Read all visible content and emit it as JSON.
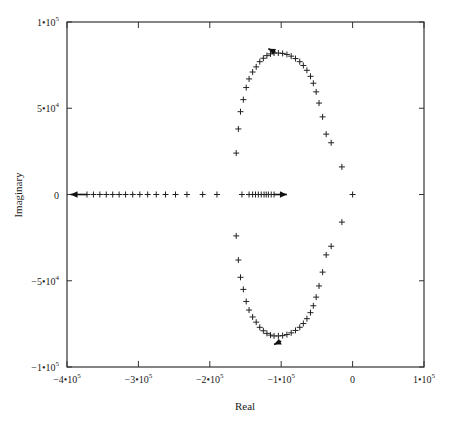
{
  "chart_data": {
    "type": "scatter",
    "title": "",
    "xlabel": "Real",
    "ylabel": "Imaginary",
    "xlim": [
      -400000,
      100000
    ],
    "ylim": [
      -100000,
      100000
    ],
    "grid": false,
    "legend": null,
    "x_ticks": [
      {
        "value": -400000,
        "mant": "-4•10",
        "exp": "5"
      },
      {
        "value": -300000,
        "mant": "-3•10",
        "exp": "5"
      },
      {
        "value": -200000,
        "mant": "-2•10",
        "exp": "5"
      },
      {
        "value": -100000,
        "mant": "-1•10",
        "exp": "5"
      },
      {
        "value": 0,
        "mant": "0",
        "exp": ""
      },
      {
        "value": 100000,
        "mant": "1•10",
        "exp": "5"
      }
    ],
    "y_ticks": [
      {
        "value": 100000,
        "mant": "1•10",
        "exp": "5"
      },
      {
        "value": 50000,
        "mant": "5•10",
        "exp": "4"
      },
      {
        "value": 0,
        "mant": "0",
        "exp": ""
      },
      {
        "value": -50000,
        "mant": "-5•10",
        "exp": "4"
      },
      {
        "value": -100000,
        "mant": "-1•10",
        "exp": "5"
      }
    ],
    "series": [
      {
        "name": "real-axis branch (leftward)",
        "marker": "+",
        "points": [
          [
            -372000,
            0
          ],
          [
            -363000,
            0
          ],
          [
            -354000,
            0
          ],
          [
            -345000,
            0
          ],
          [
            -336000,
            0
          ],
          [
            -327000,
            0
          ],
          [
            -318000,
            0
          ],
          [
            -308000,
            0
          ],
          [
            -298000,
            0
          ],
          [
            -287000,
            0
          ],
          [
            -275000,
            0
          ],
          [
            -262000,
            0
          ],
          [
            -248000,
            0
          ],
          [
            -232000,
            0
          ],
          [
            -210000,
            0
          ],
          [
            -190000,
            0
          ]
        ],
        "arrow": {
          "from": [
            -372000,
            0
          ],
          "to": [
            -395000,
            0
          ]
        }
      },
      {
        "name": "real-axis branch (rightward)",
        "marker": "+",
        "points": [
          [
            -155000,
            0
          ],
          [
            -145000,
            0
          ],
          [
            -140000,
            0
          ],
          [
            -136000,
            0
          ],
          [
            -132000,
            0
          ],
          [
            -128000,
            0
          ],
          [
            -124000,
            0
          ],
          [
            -121000,
            0
          ],
          [
            -118000,
            0
          ],
          [
            -114000,
            0
          ],
          [
            -110000,
            0
          ]
        ],
        "arrow": {
          "from": [
            -110000,
            0
          ],
          "to": [
            -92000,
            0
          ]
        }
      },
      {
        "name": "origin pole",
        "marker": "+",
        "points": [
          [
            0,
            0
          ]
        ]
      },
      {
        "name": "upper complex branch",
        "marker": "+",
        "points": [
          [
            -163000,
            24000
          ],
          [
            -160000,
            38000
          ],
          [
            -157000,
            48000
          ],
          [
            -153000,
            55000
          ],
          [
            -149000,
            62000
          ],
          [
            -145000,
            67000
          ],
          [
            -140000,
            71000
          ],
          [
            -135000,
            74000
          ],
          [
            -130000,
            77000
          ],
          [
            -125000,
            79000
          ],
          [
            -120000,
            80500
          ],
          [
            -115000,
            81500
          ],
          [
            -110000,
            82000
          ],
          [
            -104000,
            82000
          ],
          [
            -98000,
            81800
          ],
          [
            -92000,
            81200
          ],
          [
            -86000,
            80200
          ],
          [
            -80000,
            78800
          ],
          [
            -74000,
            77000
          ],
          [
            -69000,
            74800
          ],
          [
            -64000,
            72000
          ],
          [
            -59000,
            68500
          ],
          [
            -55000,
            64500
          ],
          [
            -51000,
            59500
          ],
          [
            -47000,
            53000
          ],
          [
            -42000,
            45000
          ],
          [
            -37000,
            35000
          ],
          [
            -30000,
            30000
          ],
          [
            -15000,
            16000
          ]
        ],
        "arrow": {
          "from": [
            -108000,
            82500
          ],
          "to": [
            -118000,
            84500
          ]
        }
      },
      {
        "name": "lower complex branch",
        "marker": "+",
        "points": [
          [
            -163000,
            -24000
          ],
          [
            -160000,
            -38000
          ],
          [
            -157000,
            -48000
          ],
          [
            -153000,
            -55000
          ],
          [
            -149000,
            -62000
          ],
          [
            -145000,
            -67000
          ],
          [
            -140000,
            -71000
          ],
          [
            -135000,
            -74000
          ],
          [
            -130000,
            -77000
          ],
          [
            -125000,
            -79000
          ],
          [
            -120000,
            -80500
          ],
          [
            -115000,
            -81500
          ],
          [
            -110000,
            -82000
          ],
          [
            -104000,
            -82000
          ],
          [
            -98000,
            -81800
          ],
          [
            -92000,
            -81200
          ],
          [
            -86000,
            -80200
          ],
          [
            -80000,
            -78800
          ],
          [
            -74000,
            -77000
          ],
          [
            -69000,
            -74800
          ],
          [
            -64000,
            -72000
          ],
          [
            -59000,
            -68500
          ],
          [
            -55000,
            -64500
          ],
          [
            -51000,
            -59500
          ],
          [
            -47000,
            -53000
          ],
          [
            -42000,
            -45000
          ],
          [
            -37000,
            -35000
          ],
          [
            -30000,
            -30000
          ],
          [
            -15000,
            -16000
          ]
        ],
        "arrow": {
          "from": [
            -100000,
            -85000
          ],
          "to": [
            -110000,
            -87000
          ]
        }
      }
    ]
  }
}
